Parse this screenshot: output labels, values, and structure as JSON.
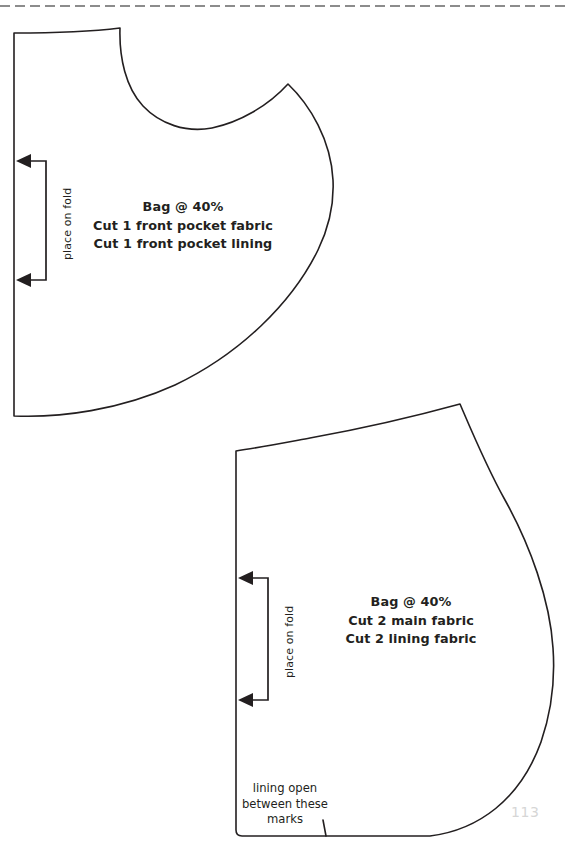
{
  "page": {
    "number": "113",
    "width": 566,
    "height": 851,
    "background": "#ffffff",
    "ink_color": "#231f20",
    "trim_line_color": "#8c8c8c",
    "page_number_color": "#d6d6d6"
  },
  "trim_line": {
    "name": "trim-guide-dashed-line",
    "style": "dashed",
    "y": 6
  },
  "pieces": [
    {
      "id": "front-pocket",
      "labels": [
        "Bag @ 40%",
        "Cut 1 front pocket fabric",
        "Cut 1 front pocket lining"
      ],
      "fold_marker": {
        "text": "place on fold",
        "arrow_top_y": 161,
        "arrow_bottom_y": 280,
        "tip_x": 16,
        "spine_x": 46
      },
      "outline_path": "M 14 33 L 14 416 C 60 418 120 410 175 385 C 240 354 292 303 318 250 C 330 225 334 200 333 180 C 331 140 310 105 288 84 C 268 106 240 122 212 128 C 186 133 160 124 143 106 C 126 88 119 58 120 28 C 96 31 60 33 14 33 Z"
    },
    {
      "id": "main-body",
      "labels": [
        "Bag @ 40%",
        "Cut 2 main fabric",
        "Cut 2 lining fabric"
      ],
      "fold_marker": {
        "text": "place on fold",
        "arrow_top_y": 578,
        "arrow_bottom_y": 700,
        "tip_x": 238,
        "spine_x": 268
      },
      "note": [
        "lining open",
        "between these",
        "marks"
      ],
      "notch": {
        "name": "lining-opening-notch",
        "x": 323,
        "y_top": 820,
        "y_bottom": 836
      },
      "outline_path": "M 236 451 L 236 830 Q 236 836 242 836 L 430 836 C 478 830 520 800 541 742 C 552 710 555 676 553 648 C 550 600 530 545 505 500 C 487 468 472 432 460 404 C 420 415 360 429 310 438 C 283 443 257 448 236 451 Z"
    }
  ],
  "icons": {
    "fold_arrow": "left-arrow-head"
  }
}
